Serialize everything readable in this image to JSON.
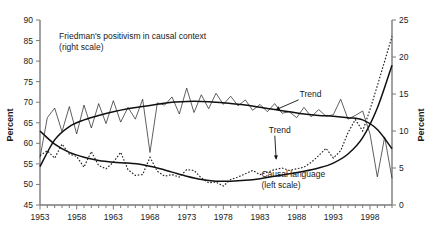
{
  "chart_data": {
    "type": "line",
    "title": "",
    "subtitle": "",
    "xlabel": "",
    "ylabel": "Percent",
    "y2label": "Percent",
    "xlim": [
      1953,
      2001
    ],
    "ylim": [
      45,
      90
    ],
    "y2lim": [
      0,
      25
    ],
    "grid": false,
    "legend_position": "inline-annotations",
    "x_tick_labels": [
      "1953",
      "1958",
      "1963",
      "1968",
      "1973",
      "1978",
      "1983",
      "1988",
      "1993",
      "1998"
    ],
    "x_tick_values": [
      1953,
      1958,
      1963,
      1968,
      1973,
      1978,
      1983,
      1988,
      1993,
      1998
    ],
    "x_minor_tick_interval": 1,
    "y_tick_labels": [
      "45",
      "50",
      "55",
      "60",
      "65",
      "70",
      "75",
      "80",
      "85",
      "90"
    ],
    "y_tick_values": [
      45,
      50,
      55,
      60,
      65,
      70,
      75,
      80,
      85,
      90
    ],
    "y2_tick_labels": [
      "0",
      "5",
      "10",
      "15",
      "20",
      "25"
    ],
    "y2_tick_values": [
      0,
      5,
      10,
      15,
      20,
      25
    ],
    "annotations": [
      {
        "id": "friedman-label",
        "text_line1": "Friedman's positivism in causal context",
        "text_line2": "(right scale)",
        "x": 1955.6,
        "y": 85.4
      },
      {
        "id": "causal-label",
        "text_line1": "Causal language",
        "text_line2": "(left scale)",
        "x": 1983.2,
        "y": 51.7
      },
      {
        "id": "trend-upper",
        "text": "Trend",
        "x": 1988.4,
        "y": 71.3,
        "arrow_to_x": 1985.2,
        "arrow_to_y": 68.2
      },
      {
        "id": "trend-lower",
        "text": "Trend",
        "x": 1984.2,
        "y": 62.6,
        "arrow_to_x": 1985.2,
        "arrow_to_y": 56.2
      }
    ],
    "series": [
      {
        "name": "Causal language (left scale)",
        "scale": "left",
        "style": "dotted",
        "x": [
          1953,
          1954,
          1955,
          1956,
          1957,
          1958,
          1959,
          1960,
          1961,
          1962,
          1963,
          1964,
          1965,
          1966,
          1967,
          1968,
          1969,
          1970,
          1971,
          1972,
          1973,
          1974,
          1975,
          1976,
          1977,
          1978,
          1979,
          1980,
          1981,
          1982,
          1983,
          1984,
          1985,
          1986,
          1987,
          1988,
          1989,
          1990,
          1991,
          1992,
          1993,
          1994,
          1995,
          1996,
          1997,
          1998,
          1999,
          2000,
          2001
        ],
        "values": [
          57.0,
          58.2,
          56.4,
          59.8,
          57.4,
          56.8,
          54.2,
          58.0,
          54.6,
          53.8,
          55.4,
          57.8,
          53.6,
          52.2,
          52.4,
          56.6,
          53.2,
          52.0,
          52.4,
          51.8,
          53.6,
          53.4,
          51.6,
          50.4,
          50.6,
          49.6,
          51.2,
          51.8,
          52.6,
          53.4,
          52.4,
          53.0,
          53.6,
          54.0,
          53.4,
          53.8,
          54.2,
          55.4,
          57.0,
          58.8,
          56.4,
          58.2,
          62.6,
          65.8,
          63.0,
          68.2,
          74.0,
          80.0,
          86.0
        ]
      },
      {
        "name": "Causal language trend (left scale)",
        "scale": "left",
        "style": "smooth-trend",
        "x": [
          1953,
          1955,
          1957,
          1959,
          1961,
          1963,
          1965,
          1967,
          1969,
          1971,
          1973,
          1975,
          1977,
          1979,
          1981,
          1983,
          1985,
          1987,
          1989,
          1991,
          1993,
          1995,
          1997,
          1999,
          2001
        ],
        "values": [
          63.0,
          59.8,
          57.8,
          56.6,
          55.8,
          55.4,
          55.2,
          54.8,
          54.0,
          53.0,
          52.0,
          51.2,
          50.8,
          50.8,
          51.0,
          51.4,
          52.0,
          52.6,
          53.2,
          54.0,
          55.2,
          57.4,
          61.4,
          68.6,
          79.0
        ]
      },
      {
        "name": "Friedman's positivism in causal context (right scale)",
        "scale": "right",
        "style": "thin-line",
        "x": [
          1953,
          1954,
          1955,
          1956,
          1957,
          1958,
          1959,
          1960,
          1961,
          1962,
          1963,
          1964,
          1965,
          1966,
          1967,
          1968,
          1969,
          1970,
          1971,
          1972,
          1973,
          1974,
          1975,
          1976,
          1977,
          1978,
          1979,
          1980,
          1981,
          1982,
          1983,
          1984,
          1985,
          1986,
          1987,
          1988,
          1989,
          1990,
          1991,
          1992,
          1993,
          1994,
          1995,
          1996,
          1997,
          1998,
          1999,
          2000,
          2001
        ],
        "values": [
          6.4,
          11.8,
          13.1,
          9.9,
          13.3,
          9.6,
          13.5,
          10.4,
          13.7,
          11.0,
          14.1,
          11.2,
          13.2,
          11.6,
          14.3,
          7.1,
          13.8,
          13.5,
          14.6,
          12.3,
          15.8,
          12.5,
          14.9,
          13.0,
          15.1,
          13.6,
          14.7,
          13.4,
          14.2,
          12.8,
          13.6,
          12.6,
          13.7,
          12.4,
          12.6,
          11.8,
          13.2,
          11.9,
          12.9,
          12.0,
          12.2,
          14.3,
          11.6,
          12.1,
          12.7,
          9.6,
          3.8,
          9.2,
          3.6
        ]
      },
      {
        "name": "Friedman's positivism trend (right scale)",
        "scale": "right",
        "style": "smooth-trend",
        "x": [
          1953,
          1955,
          1957,
          1959,
          1961,
          1963,
          1965,
          1967,
          1969,
          1971,
          1973,
          1975,
          1977,
          1979,
          1981,
          1983,
          1985,
          1987,
          1989,
          1991,
          1993,
          1995,
          1997,
          1999,
          2001
        ],
        "values": [
          5.2,
          8.8,
          10.6,
          11.5,
          12.1,
          12.6,
          13.0,
          13.3,
          13.6,
          13.9,
          14.0,
          14.0,
          13.9,
          13.7,
          13.5,
          13.2,
          12.9,
          12.6,
          12.3,
          12.1,
          12.0,
          11.8,
          11.5,
          10.2,
          7.6
        ]
      }
    ]
  }
}
